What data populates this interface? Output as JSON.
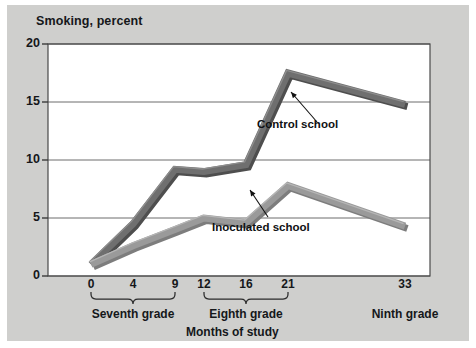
{
  "figure": {
    "background_color": "#cfcfcd",
    "plot_background_color": "#ffffff",
    "border_color": "#4a4a4a"
  },
  "axes": {
    "y_title": "Smoking, percent",
    "y_ticks": [
      "20",
      "15",
      "10",
      "5",
      "0"
    ],
    "y_values": [
      20,
      15,
      10,
      5,
      0
    ],
    "x_title": "Months of study",
    "x_ticks": [
      "0",
      "4",
      "9",
      "12",
      "16",
      "21",
      "33"
    ],
    "x_values": [
      0,
      4,
      9,
      12,
      16,
      21,
      33
    ]
  },
  "groups": [
    {
      "label": "Seventh grade",
      "from": 0,
      "to": 9,
      "brace": true
    },
    {
      "label": "Eighth grade",
      "from": 12,
      "to": 21,
      "brace": true
    },
    {
      "label": "Ninth grade",
      "from": 33,
      "to": 33,
      "brace": false
    }
  ],
  "annotations": [
    {
      "name": "control-school",
      "text": "Control school",
      "color": "#0f1113"
    },
    {
      "name": "inoculated-school",
      "text": "Inoculated school",
      "color": "#0f1113"
    }
  ],
  "chart_data": {
    "type": "line",
    "title": "Smoking, percent",
    "xlabel": "Months of study",
    "ylabel": "Smoking, percent",
    "xlim": [
      0,
      33
    ],
    "ylim": [
      0,
      20
    ],
    "grid": true,
    "grid_axis": "y",
    "legend": "annotated inline",
    "x": [
      0,
      4,
      9,
      12,
      16,
      21,
      33
    ],
    "x_tick_labels": [
      "0",
      "4",
      "9",
      "12",
      "16",
      "21",
      "33"
    ],
    "y_tick_labels": [
      "0",
      "5",
      "10",
      "15",
      "20"
    ],
    "series": [
      {
        "name": "Control school",
        "color": "#6f6f6f",
        "values": [
          1.0,
          4.5,
          9.2,
          9.0,
          9.6,
          17.5,
          14.8
        ]
      },
      {
        "name": "Inoculated school",
        "color": "#9a9a9a",
        "values": [
          1.0,
          2.6,
          4.0,
          5.0,
          4.6,
          7.8,
          4.3
        ]
      }
    ]
  }
}
